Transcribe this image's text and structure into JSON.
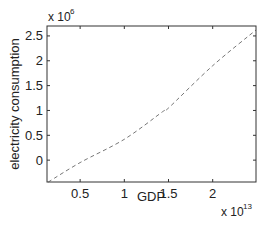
{
  "chart_data": {
    "type": "line",
    "title": "",
    "xlabel": "GDP",
    "ylabel": "electricity consumption",
    "x_multiplier": "x 10",
    "x_multiplier_exp": "13",
    "y_multiplier": "x 10",
    "y_multiplier_exp": "6",
    "xlim": [
      0.125,
      2.49
    ],
    "ylim": [
      -0.44,
      2.7
    ],
    "x_ticks": [
      0.5,
      1,
      1.5,
      2
    ],
    "x_tick_labels": [
      "0.5",
      "1",
      "1.5",
      "2"
    ],
    "y_ticks": [
      0,
      0.5,
      1,
      1.5,
      2,
      2.5
    ],
    "y_tick_labels": [
      "0",
      "0.5",
      "1",
      "1.5",
      "2",
      "2.5"
    ],
    "grid": false,
    "legend": null,
    "series": [
      {
        "name": "fit",
        "style": "dashed",
        "color": "#777777",
        "x": [
          0.14,
          0.5,
          1.0,
          1.43,
          1.5,
          2.0,
          2.49
        ],
        "y": [
          -0.44,
          -0.05,
          0.42,
          0.97,
          1.05,
          1.9,
          2.62
        ]
      }
    ]
  }
}
